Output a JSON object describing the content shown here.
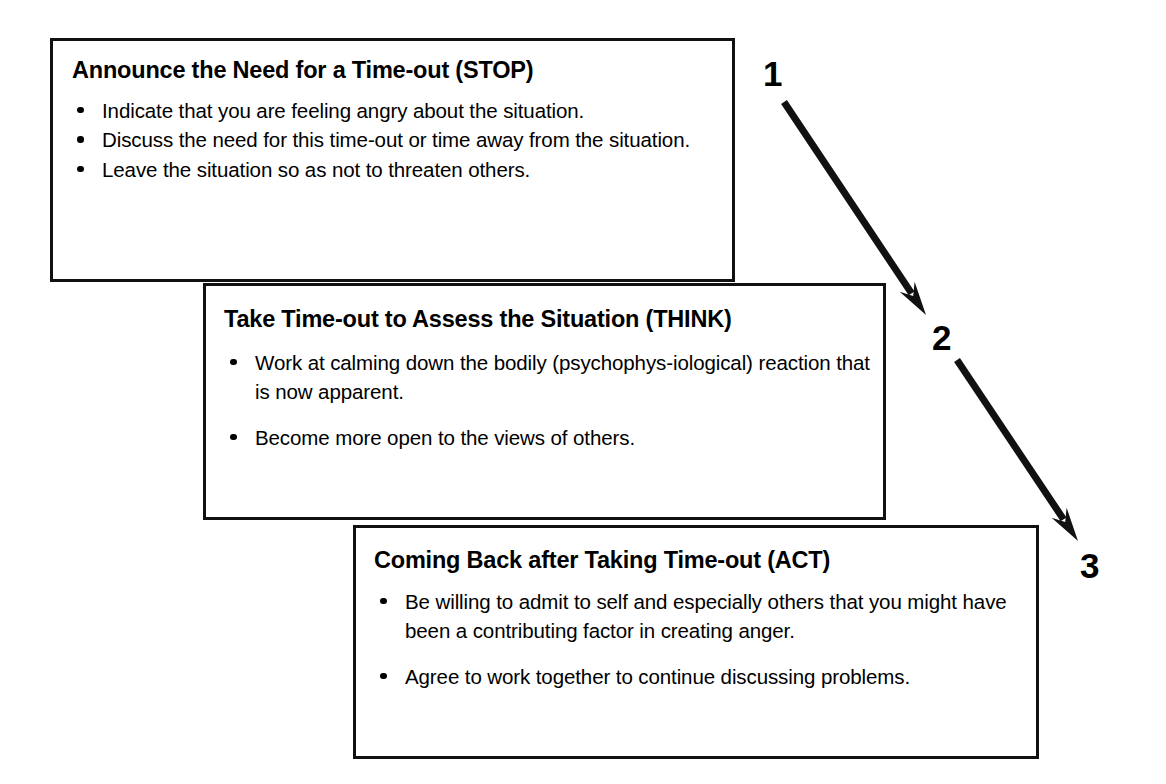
{
  "diagram": {
    "ink_color": "#111111",
    "background_color": "#ffffff",
    "boxes": [
      {
        "step": "1",
        "heading": "Announce the Need for a Time-out (STOP)",
        "bullets": [
          "Indicate that you are feeling angry about the situation.",
          "Discuss the need for this time-out or time away from the situation.",
          "Leave the situation so as not to threaten others."
        ]
      },
      {
        "step": "2",
        "heading": "Take Time-out to Assess the Situation (THINK)",
        "bullets": [
          "Work at calming down the bodily (psychophys-iological) reaction that is now apparent.",
          "Become more open to the views of others."
        ]
      },
      {
        "step": "3",
        "heading": "Coming Back after Taking Time-out (ACT)",
        "bullets": [
          "Be willing to admit to self and especially others that you might have been a contributing factor in creating anger.",
          "Agree to work together to continue discussing problems."
        ]
      }
    ],
    "step_numbers": [
      "1",
      "2",
      "3"
    ],
    "arrows": [
      {
        "name": "arrow-step-1-to-2",
        "from": "1",
        "to": "2",
        "x1": 784,
        "y1": 102,
        "x2": 926,
        "y2": 315
      },
      {
        "name": "arrow-step-2-to-3",
        "from": "2",
        "to": "3",
        "x1": 957,
        "y1": 360,
        "x2": 1078,
        "y2": 541
      }
    ]
  }
}
